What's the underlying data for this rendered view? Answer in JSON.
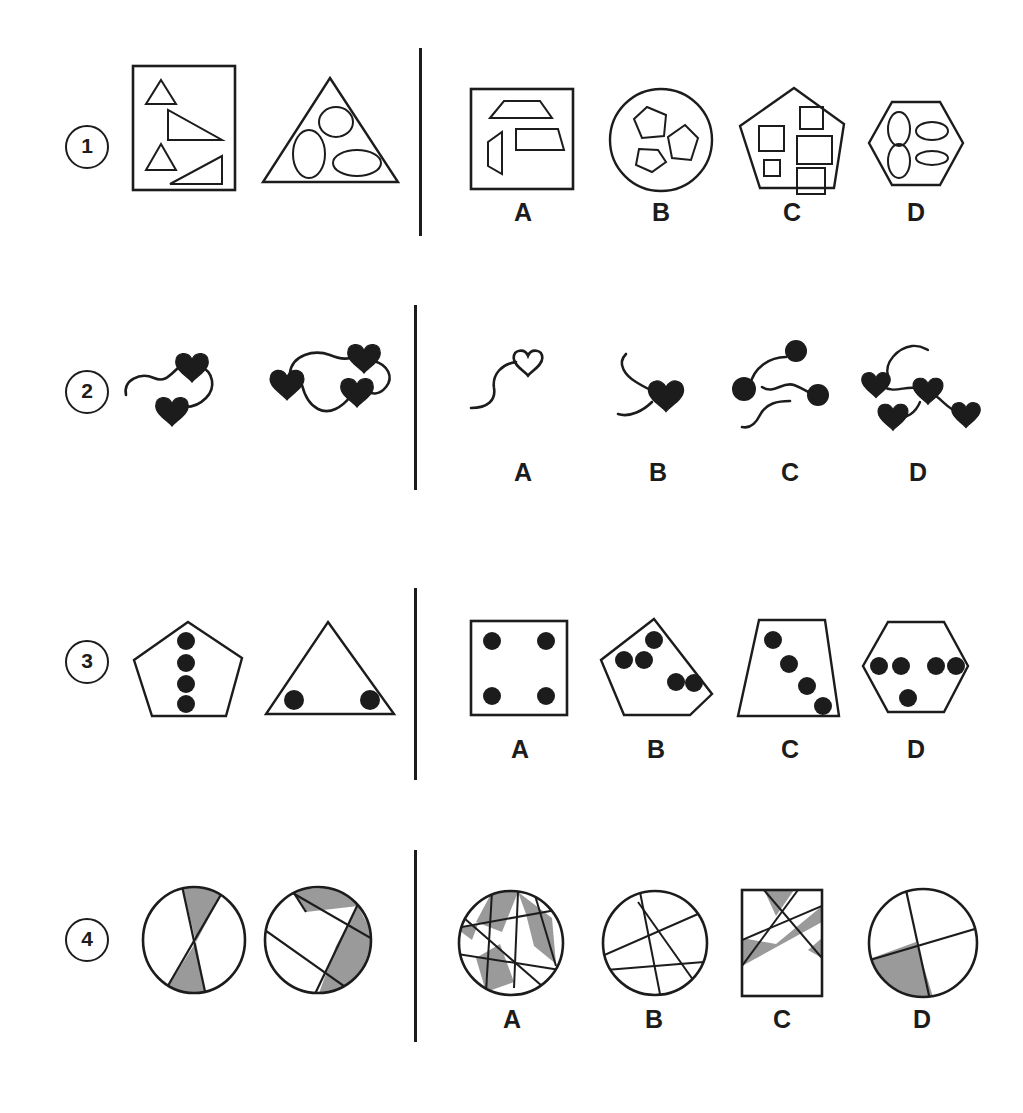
{
  "page": {
    "background_color": "#ffffff",
    "ink_color": "#1c1c1c",
    "shade_color": "#9a9a9a",
    "width": 1023,
    "height": 1113
  },
  "option_labels": [
    "A",
    "B",
    "C",
    "D"
  ],
  "rows": [
    {
      "number": "1",
      "number_glyph": "1",
      "prompt_description": "Rectangle containing four triangles; triangle containing three ellipses",
      "prompts": [
        {
          "name": "rectangle-with-triangles",
          "outer_shape": "rectangle",
          "inner_shape": "triangle",
          "inner_count": 4
        },
        {
          "name": "triangle-with-ellipses",
          "outer_shape": "triangle",
          "inner_shape": "ellipse",
          "inner_count": 3
        }
      ],
      "options": [
        {
          "label": "A",
          "name": "option-square-with-trapezoids",
          "outer_shape": "square",
          "inner_shape": "trapezoid",
          "inner_count": 3
        },
        {
          "label": "B",
          "name": "option-circle-with-pentagons",
          "outer_shape": "circle",
          "inner_shape": "pentagon",
          "inner_count": 3
        },
        {
          "label": "C",
          "name": "option-pentagon-with-squares",
          "outer_shape": "pentagon",
          "inner_shape": "square",
          "inner_count": 5
        },
        {
          "label": "D",
          "name": "option-hexagon-with-ellipses",
          "outer_shape": "hexagon",
          "inner_shape": "ellipse",
          "inner_count": 4
        }
      ]
    },
    {
      "number": "2",
      "number_glyph": "2",
      "prompt_description": "Wavy lines with solid heart end-markers",
      "prompts": [
        {
          "name": "squiggle-two-hearts",
          "marker_shape": "heart",
          "marker_fill": "solid",
          "marker_count": 2
        },
        {
          "name": "squiggle-three-hearts",
          "marker_shape": "heart",
          "marker_fill": "solid",
          "marker_count": 3
        }
      ],
      "options": [
        {
          "label": "A",
          "name": "option-squiggle-one-open-heart",
          "marker_shape": "heart",
          "marker_fill": "outline",
          "marker_count": 1
        },
        {
          "label": "B",
          "name": "option-squiggle-one-solid-heart",
          "marker_shape": "heart",
          "marker_fill": "solid",
          "marker_count": 1
        },
        {
          "label": "C",
          "name": "option-squiggle-three-circles",
          "marker_shape": "circle",
          "marker_fill": "solid",
          "marker_count": 3
        },
        {
          "label": "D",
          "name": "option-squiggle-four-hearts",
          "marker_shape": "heart",
          "marker_fill": "solid",
          "marker_count": 4
        }
      ]
    },
    {
      "number": "3",
      "number_glyph": "3",
      "prompt_description": "Polygons containing solid black dots",
      "prompts": [
        {
          "name": "pentagon-four-dots",
          "outer_shape": "pentagon",
          "dot_count": 4
        },
        {
          "name": "triangle-two-dots",
          "outer_shape": "triangle",
          "dot_count": 2
        }
      ],
      "options": [
        {
          "label": "A",
          "name": "option-square-four-dots",
          "outer_shape": "square",
          "dot_count": 4
        },
        {
          "label": "B",
          "name": "option-pentagon-five-dots",
          "outer_shape": "pentagon",
          "dot_count": 5
        },
        {
          "label": "C",
          "name": "option-trapezoid-four-dots",
          "outer_shape": "trapezoid",
          "dot_count": 4
        },
        {
          "label": "D",
          "name": "option-hexagon-five-dots",
          "outer_shape": "hexagon",
          "dot_count": 5
        }
      ]
    },
    {
      "number": "4",
      "number_glyph": "4",
      "prompt_description": "Circles divided by straight chords with some regions shaded grey",
      "prompts": [
        {
          "name": "circle-two-chords-bowtie-shaded",
          "outer_shape": "circle",
          "chord_count": 2,
          "shaded_regions": 2
        },
        {
          "name": "circle-three-chords-shaded",
          "outer_shape": "circle",
          "chord_count": 3,
          "shaded_regions": 2
        }
      ],
      "options": [
        {
          "label": "A",
          "name": "option-circle-many-chords-shaded",
          "outer_shape": "circle",
          "chord_count": 5,
          "shaded_regions": 4
        },
        {
          "label": "B",
          "name": "option-circle-chords-unshaded",
          "outer_shape": "circle",
          "chord_count": 4,
          "shaded_regions": 0
        },
        {
          "label": "C",
          "name": "option-rectangle-chords-shaded",
          "outer_shape": "rectangle",
          "chord_count": 3,
          "shaded_regions": 2
        },
        {
          "label": "D",
          "name": "option-circle-two-chords-one-shaded",
          "outer_shape": "circle",
          "chord_count": 2,
          "shaded_regions": 1
        }
      ]
    }
  ]
}
